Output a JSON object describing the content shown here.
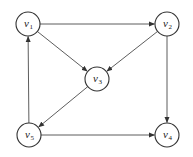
{
  "diagram": {
    "type": "directed-graph",
    "colors": {
      "stroke": "#333333",
      "node_fill": "#ffffff",
      "text": "#222222"
    },
    "nodes": [
      {
        "id": "v1",
        "label": "v",
        "sub": "1",
        "x": 28,
        "y": 24
      },
      {
        "id": "v2",
        "label": "v",
        "sub": "2",
        "x": 167,
        "y": 24
      },
      {
        "id": "v3",
        "label": "v",
        "sub": "3",
        "x": 97,
        "y": 79
      },
      {
        "id": "v4",
        "label": "v",
        "sub": "4",
        "x": 167,
        "y": 135
      },
      {
        "id": "v5",
        "label": "v",
        "sub": "5",
        "x": 29,
        "y": 135
      }
    ],
    "edges": [
      {
        "from": "v1",
        "to": "v2"
      },
      {
        "from": "v1",
        "to": "v3"
      },
      {
        "from": "v2",
        "to": "v3"
      },
      {
        "from": "v2",
        "to": "v4"
      },
      {
        "from": "v3",
        "to": "v5"
      },
      {
        "from": "v5",
        "to": "v1"
      },
      {
        "from": "v5",
        "to": "v4"
      }
    ],
    "node_radius": 12
  }
}
